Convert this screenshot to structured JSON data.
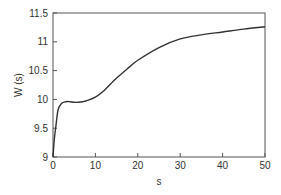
{
  "chart_data": {
    "type": "line",
    "title": "",
    "xlabel": "s",
    "ylabel": "W (s)",
    "xlim": [
      0,
      50
    ],
    "ylim": [
      9,
      11.5
    ],
    "xticks": [
      0,
      10,
      20,
      30,
      40,
      50
    ],
    "yticks": [
      9,
      9.5,
      10,
      10.5,
      11,
      11.5
    ],
    "xtick_labels": [
      "0",
      "10",
      "20",
      "30",
      "40",
      "50"
    ],
    "ytick_labels": [
      "9",
      "9.5",
      "10",
      "10.5",
      "11",
      "11.5"
    ],
    "grid": false,
    "legend": null,
    "series": [
      {
        "name": "W(s)",
        "color": "#333333",
        "x": [
          0,
          0.3,
          0.7,
          1.2,
          2,
          3,
          4,
          5,
          6,
          7,
          8,
          10,
          12,
          15,
          18,
          20,
          25,
          30,
          35,
          40,
          45,
          50
        ],
        "y": [
          9.0,
          9.3,
          9.55,
          9.82,
          9.93,
          9.96,
          9.96,
          9.95,
          9.95,
          9.96,
          9.98,
          10.04,
          10.15,
          10.37,
          10.56,
          10.68,
          10.9,
          11.05,
          11.12,
          11.17,
          11.22,
          11.26
        ]
      }
    ]
  }
}
